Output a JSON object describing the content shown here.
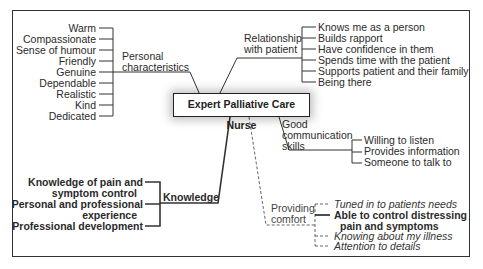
{
  "diagram": {
    "center": "Expert Palliative Care Nurse",
    "branches": {
      "personal": {
        "label_line1": "Personal",
        "label_line2": "characteristics",
        "items": [
          "Warm",
          "Compassionate",
          "Sense of humour",
          "Friendly",
          "Genuine",
          "Dependable",
          "Realistic",
          "Kind",
          "Dedicated"
        ]
      },
      "relationship": {
        "label_line1": "Relationship",
        "label_line2": "with patient",
        "items": [
          "Knows me as a person",
          "Builds rapport",
          "Have confidence in them",
          "Spends time with the patient",
          "Supports patient and their family",
          "Being there"
        ]
      },
      "communication": {
        "label_line1": "Good",
        "label_line2": "communication",
        "label_line3": "skills",
        "items": [
          "Willing to listen",
          "Provides information",
          "Someone to talk to"
        ]
      },
      "knowledge": {
        "label": "Knowledge",
        "items": [
          {
            "line1": "Knowledge of pain and",
            "line2": "symptom control"
          },
          {
            "line1": "Personal and professional",
            "line2": "experience"
          },
          {
            "line1": "Professional development"
          }
        ]
      },
      "comfort": {
        "label_line1": "Providing",
        "label_line2": "comfort",
        "items": [
          {
            "text": "Tuned in to patients needs",
            "style": "italic-dashed"
          },
          {
            "line1": "Able to control distressing",
            "line2": "pain and symptoms",
            "style": "bold-solid"
          },
          {
            "text": "Knowing about my illness",
            "style": "italic-dashed"
          },
          {
            "text": "Attention to details",
            "style": "italic-dashed"
          }
        ]
      }
    }
  }
}
